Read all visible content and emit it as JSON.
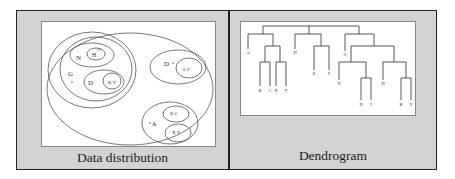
{
  "panels": [
    {
      "id": "data-distribution",
      "caption": "Data distribution",
      "clusters": [
        {
          "label": "G",
          "children": [
            {
              "label": "N",
              "children": [
                {
                  "label": "H",
                  "points": [
                    "H",
                    "I"
                  ]
                }
              ]
            },
            {
              "label": "D",
              "children": [
                {
                  "label": "K",
                  "points": [
                    "K",
                    "Y"
                  ]
                }
              ]
            }
          ]
        },
        {
          "label": "D",
          "children": [
            {
              "label": "E F",
              "points": [
                "E",
                "F"
              ]
            }
          ]
        },
        {
          "label": "A",
          "children": [
            {
              "label": "B C",
              "points": [
                "B",
                "C"
              ]
            },
            {
              "label": "X Y",
              "points": [
                "X",
                "Y"
              ]
            }
          ]
        }
      ],
      "labels": {
        "g": "G",
        "n": "N",
        "h": "H",
        "hi": "I I",
        "d1": "D",
        "ky": "K Y",
        "d2": "D",
        "ef": "E F",
        "a": "A",
        "bc": "B C",
        "xy": "X Y"
      }
    },
    {
      "id": "dendrogram",
      "caption": "Dendrogram",
      "leaves": [
        "A",
        "B",
        "C",
        "X",
        "Y",
        "D",
        "E",
        "F",
        "G",
        "N",
        "H",
        "I",
        "D",
        "K",
        "Y"
      ],
      "labels": {
        "a": "A",
        "b": "B",
        "c": "C",
        "x": "X",
        "y": "Y",
        "d": "D",
        "e": "E",
        "f": "F",
        "g": "G",
        "n": "N",
        "h": "H",
        "i": "I",
        "d2": "D",
        "k": "K",
        "y2": "Y"
      }
    }
  ]
}
